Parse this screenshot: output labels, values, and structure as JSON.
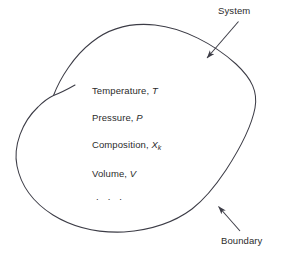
{
  "figure": {
    "type": "thermodynamic-system-diagram",
    "background_color": "#ffffff",
    "stroke_color": "#3c3c46",
    "text_color": "#2b2b2b"
  },
  "properties": [
    {
      "name": "temperature",
      "label": "Temperature,",
      "symbol": "T",
      "subscript": ""
    },
    {
      "name": "pressure",
      "label": "Pressure,",
      "symbol": "P",
      "subscript": ""
    },
    {
      "name": "composition",
      "label": "Composition,",
      "symbol": "X",
      "subscript": "k"
    },
    {
      "name": "volume",
      "label": "Volume,",
      "symbol": "V",
      "subscript": ""
    }
  ],
  "ellipsis": ". . .",
  "callouts": {
    "system": "System",
    "boundary": "Boundary"
  }
}
